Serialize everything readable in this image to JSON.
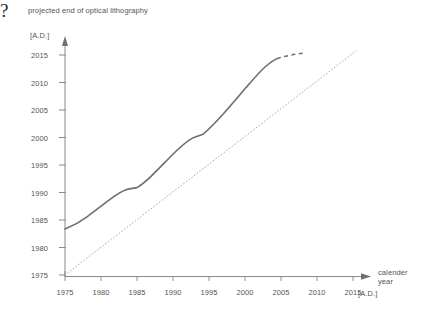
{
  "chart_data": {
    "type": "line",
    "title": "projected end of optical lithography",
    "xlabel": "calender year",
    "xunit": "[A.D.]",
    "ylabel": "projected end of optical lithography",
    "yunit": "[A.D.]",
    "xlim": [
      1975,
      2017
    ],
    "ylim": [
      1975,
      2016
    ],
    "xticks": [
      1975,
      1980,
      1985,
      1990,
      1995,
      2000,
      2005,
      2010,
      2015
    ],
    "yticks": [
      1975,
      1980,
      1985,
      1990,
      1995,
      2000,
      2005,
      2010,
      2015
    ],
    "grid": false,
    "legend": null,
    "annotations": [
      {
        "text": "?",
        "x": 2011,
        "y": 2016.5,
        "name": "question-mark-annotation"
      }
    ],
    "series": [
      {
        "name": "projected end of optical lithography",
        "style": "solid",
        "color": "#6b6b6b",
        "x": [
          1975,
          1977,
          1979,
          1981,
          1983,
          1984.5,
          1985.5,
          1987,
          1989,
          1991,
          1993,
          1995,
          1996.5,
          1998,
          2000,
          2002,
          2004,
          2005.5,
          2006.5
        ],
        "y": [
          1983.5,
          1984.5,
          1985.8,
          1987.2,
          1988.6,
          1989.2,
          1989.4,
          1991.2,
          1993.4,
          1995.6,
          1997.8,
          1999.8,
          2000.4,
          2002.4,
          2005.0,
          2007.6,
          2010.6,
          2012.8,
          2013.6
        ]
      },
      {
        "name": "projected end of optical lithography (extrapolated)",
        "style": "dashed",
        "color": "#6b6b6b",
        "x": [
          2006.5,
          2008.0,
          2009.3,
          2010.2
        ],
        "y": [
          2013.6,
          2014.2,
          2014.5,
          2014.7
        ]
      },
      {
        "name": "calender year reference (y = x)",
        "style": "dotted",
        "color": "#9a9a9a",
        "x": [
          1975,
          2017
        ],
        "y": [
          1975,
          2015.8
        ]
      }
    ]
  },
  "axes": {
    "x_axis_name": "calender-year-axis",
    "y_axis_name": "projected-end-axis"
  }
}
